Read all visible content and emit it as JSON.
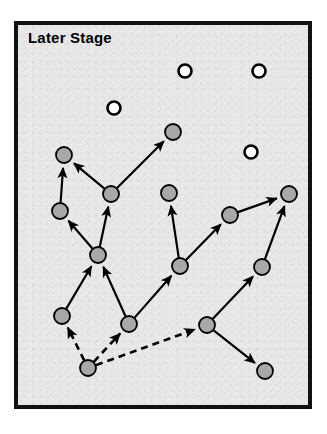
{
  "panel": {
    "title": "Later Stage",
    "background_color": "#e8e8e8",
    "border_color": "#111111",
    "x": 14,
    "y": 21,
    "width": 298,
    "height": 388
  },
  "chart_data": {
    "type": "diagram",
    "title": "Later Stage",
    "xlabel": "",
    "ylabel": "",
    "legend": [],
    "node_styles": {
      "filled": {
        "fill": "#a8a8a8",
        "stroke": "#000000",
        "radius": 8,
        "meaning": "connected node"
      },
      "open": {
        "fill": "#ffffff",
        "stroke": "#000000",
        "radius": 6.5,
        "meaning": "isolated node"
      }
    },
    "edge_styles": {
      "solid": {
        "stroke": "#000000",
        "width": 2.2,
        "meaning": "established link"
      },
      "dashed": {
        "stroke": "#000000",
        "width": 2.6,
        "dash": "7,5",
        "meaning": "new / emerging link"
      }
    },
    "nodes": [
      {
        "id": "n1",
        "x": 64,
        "y": 155,
        "type": "filled"
      },
      {
        "id": "n2",
        "x": 111,
        "y": 194,
        "type": "filled"
      },
      {
        "id": "n3",
        "x": 173,
        "y": 132,
        "type": "filled"
      },
      {
        "id": "n4",
        "x": 60,
        "y": 211,
        "type": "filled"
      },
      {
        "id": "n5",
        "x": 169,
        "y": 193,
        "type": "filled"
      },
      {
        "id": "n6",
        "x": 98,
        "y": 255,
        "type": "filled"
      },
      {
        "id": "n7",
        "x": 230,
        "y": 215,
        "type": "filled"
      },
      {
        "id": "n8",
        "x": 289,
        "y": 194,
        "type": "filled"
      },
      {
        "id": "n9",
        "x": 62,
        "y": 316,
        "type": "filled"
      },
      {
        "id": "n10",
        "x": 129,
        "y": 324,
        "type": "filled"
      },
      {
        "id": "n11",
        "x": 180,
        "y": 266,
        "type": "filled"
      },
      {
        "id": "n12",
        "x": 262,
        "y": 267,
        "type": "filled"
      },
      {
        "id": "n13",
        "x": 207,
        "y": 325,
        "type": "filled"
      },
      {
        "id": "n14",
        "x": 265,
        "y": 371,
        "type": "filled"
      },
      {
        "id": "n15",
        "x": 88,
        "y": 368,
        "type": "filled"
      },
      {
        "id": "o1",
        "x": 185,
        "y": 71,
        "type": "open"
      },
      {
        "id": "o2",
        "x": 259,
        "y": 71,
        "type": "open"
      },
      {
        "id": "o3",
        "x": 114,
        "y": 108,
        "type": "open"
      },
      {
        "id": "o4",
        "x": 251,
        "y": 152,
        "type": "open"
      }
    ],
    "edges": [
      {
        "from": "n4",
        "to": "n1",
        "style": "solid"
      },
      {
        "from": "n2",
        "to": "n1",
        "style": "solid"
      },
      {
        "from": "n2",
        "to": "n3",
        "style": "solid"
      },
      {
        "from": "n6",
        "to": "n2",
        "style": "solid"
      },
      {
        "from": "n6",
        "to": "n4",
        "style": "solid"
      },
      {
        "from": "n9",
        "to": "n6",
        "style": "solid"
      },
      {
        "from": "n10",
        "to": "n6",
        "style": "solid"
      },
      {
        "from": "n11",
        "to": "n5",
        "style": "solid"
      },
      {
        "from": "n11",
        "to": "n7",
        "style": "solid"
      },
      {
        "from": "n10",
        "to": "n11",
        "style": "solid"
      },
      {
        "from": "n7",
        "to": "n8",
        "style": "solid"
      },
      {
        "from": "n12",
        "to": "n8",
        "style": "solid"
      },
      {
        "from": "n13",
        "to": "n12",
        "style": "solid"
      },
      {
        "from": "n13",
        "to": "n14",
        "style": "solid"
      },
      {
        "from": "n15",
        "to": "n9",
        "style": "dashed"
      },
      {
        "from": "n15",
        "to": "n10",
        "style": "dashed"
      },
      {
        "from": "n15",
        "to": "n13",
        "style": "dashed"
      }
    ],
    "counts": {
      "filled_nodes": 15,
      "open_nodes": 4,
      "solid_edges": 14,
      "dashed_edges": 3
    }
  }
}
